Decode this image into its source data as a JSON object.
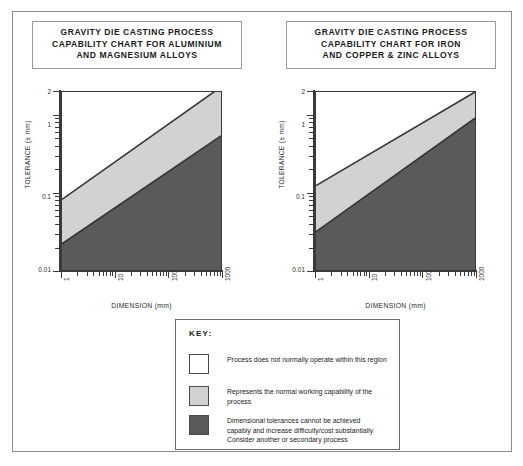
{
  "charts": [
    {
      "id": "aluminium-magnesium",
      "title_lines": [
        "GRAVITY DIE CASTING PROCESS",
        "CAPABILITY CHART FOR ALUMINIUM",
        "AND MAGNESIUM ALLOYS"
      ],
      "xlabel": "DIMENSION (mm)",
      "ylabel": "TOLERANCE (± mm)",
      "xticks": [
        "1",
        "10",
        "100",
        "1000"
      ],
      "yticks": [
        "2",
        "1",
        "0.1",
        "0.01"
      ]
    },
    {
      "id": "iron-copper-zinc",
      "title_lines": [
        "GRAVITY DIE CASTING PROCESS",
        "CAPABILITY CHART FOR IRON",
        "AND COPPER & ZINC ALLOYS"
      ],
      "xlabel": "DIMENSION (mm)",
      "ylabel": "TOLERANCE (± mm)",
      "xticks": [
        "1",
        "10",
        "100",
        "1000"
      ],
      "yticks": [
        "2",
        "1",
        "0.1",
        "0.01"
      ]
    }
  ],
  "key": {
    "heading": "KEY:",
    "items": [
      {
        "swatch": "white",
        "lines": [
          "Process does not normally operate within this region"
        ]
      },
      {
        "swatch": "light-grey",
        "lines": [
          "Represents the normal working capability of the",
          "process"
        ]
      },
      {
        "swatch": "dark-grey",
        "lines": [
          "Dimensional tolerances cannot be achieved",
          "capably and increase difficulty/cost substantially",
          "Consider another or secondary process"
        ]
      }
    ]
  },
  "colors": {
    "light_band": "#d2d2d2",
    "dark_band": "#5a5a5a",
    "white_band": "#ffffff",
    "line": "#333333",
    "frame": "#8a8a8a"
  },
  "chart_data": [
    {
      "type": "area",
      "id": "aluminium-magnesium",
      "title": "GRAVITY DIE CASTING PROCESS CAPABILITY CHART FOR ALUMINIUM AND MAGNESIUM ALLOYS",
      "xlabel": "DIMENSION (mm)",
      "ylabel": "TOLERANCE (± mm)",
      "xscale": "log",
      "yscale": "log",
      "xlim": [
        1,
        1000
      ],
      "ylim": [
        0.01,
        2
      ],
      "xticks": [
        1,
        10,
        100,
        1000
      ],
      "yticks": [
        0.01,
        0.1,
        1,
        2
      ],
      "grid": false,
      "legend": "external key box",
      "series": [
        {
          "name": "upper boundary of normal working capability",
          "x": [
            1,
            1000
          ],
          "y": [
            0.085,
            1.3
          ]
        },
        {
          "name": "lower boundary of normal working capability",
          "x": [
            1,
            1000
          ],
          "y": [
            0.026,
            0.46
          ]
        }
      ],
      "regions": [
        {
          "name": "Process does not normally operate within this region",
          "fill": "#ffffff",
          "above": "upper boundary of normal working capability"
        },
        {
          "name": "Represents the normal working capability of the process",
          "fill": "#d2d2d2",
          "between": [
            "lower boundary of normal working capability",
            "upper boundary of normal working capability"
          ]
        },
        {
          "name": "Dimensional tolerances cannot be achieved capably and increase difficulty/cost substantially. Consider another or secondary process",
          "fill": "#5a5a5a",
          "below": "lower boundary of normal working capability"
        }
      ]
    },
    {
      "type": "area",
      "id": "iron-copper-zinc",
      "title": "GRAVITY DIE CASTING PROCESS CAPABILITY CHART FOR IRON AND COPPER & ZINC ALLOYS",
      "xlabel": "DIMENSION (mm)",
      "ylabel": "TOLERANCE (± mm)",
      "xscale": "log",
      "yscale": "log",
      "xlim": [
        1,
        1000
      ],
      "ylim": [
        0.01,
        2
      ],
      "xticks": [
        1,
        10,
        100,
        1000
      ],
      "yticks": [
        0.01,
        0.1,
        1,
        2
      ],
      "grid": false,
      "legend": "external key box",
      "series": [
        {
          "name": "upper boundary of normal working capability",
          "x": [
            1,
            1000
          ],
          "y": [
            0.12,
            2.0
          ]
        },
        {
          "name": "lower boundary of normal working capability",
          "x": [
            1,
            1000
          ],
          "y": [
            0.036,
            0.65
          ]
        }
      ],
      "regions": [
        {
          "name": "Process does not normally operate within this region",
          "fill": "#ffffff",
          "above": "upper boundary of normal working capability"
        },
        {
          "name": "Represents the normal working capability of the process",
          "fill": "#d2d2d2",
          "between": [
            "lower boundary of normal working capability",
            "upper boundary of normal working capability"
          ]
        },
        {
          "name": "Dimensional tolerances cannot be achieved capably and increase difficulty/cost substantially. Consider another or secondary process",
          "fill": "#5a5a5a",
          "below": "lower boundary of normal working capability"
        }
      ]
    }
  ]
}
